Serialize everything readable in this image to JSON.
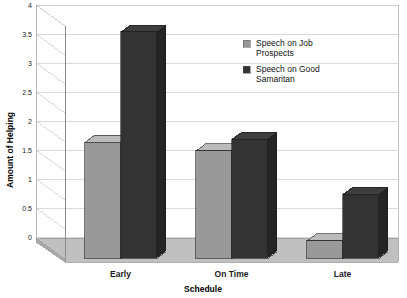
{
  "chart_data": {
    "type": "bar",
    "title": "",
    "subtitle": "",
    "xlabel": "Schedule",
    "ylabel": "Amount of Helping",
    "categories": [
      "Early",
      "On Time",
      "Late"
    ],
    "series": [
      {
        "name": "Speech on Job Prospects",
        "color": "#999999",
        "values": [
          2.0,
          1.85,
          0.3
        ]
      },
      {
        "name": "Speech on Good Samaritan",
        "color": "#333333",
        "values": [
          3.9,
          2.05,
          1.1
        ]
      }
    ],
    "ylim": [
      0,
      4
    ],
    "yticks": [
      "0",
      "0.5",
      "1",
      "1.5",
      "2",
      "2.5",
      "3",
      "3.5",
      "4"
    ],
    "ytick_values": [
      0,
      0.5,
      1,
      1.5,
      2,
      2.5,
      3,
      3.5,
      4
    ],
    "grid": true,
    "grid_axis": "y",
    "legend_position": "top-right",
    "style": "3d",
    "background_color": "#ffffff",
    "floor_color": "#b3b3b3",
    "grid_color": "#cccccc",
    "axis_color": "#808080"
  },
  "legend": {
    "entries": [
      {
        "label_line1": "Speech on Job",
        "label_line2": "Prospects",
        "color": "#999999"
      },
      {
        "label_line1": "Speech on Good",
        "label_line2": "Samaritan",
        "color": "#333333"
      }
    ]
  },
  "axes": {
    "y_title": "Amount of Helping",
    "x_title": "Schedule"
  }
}
